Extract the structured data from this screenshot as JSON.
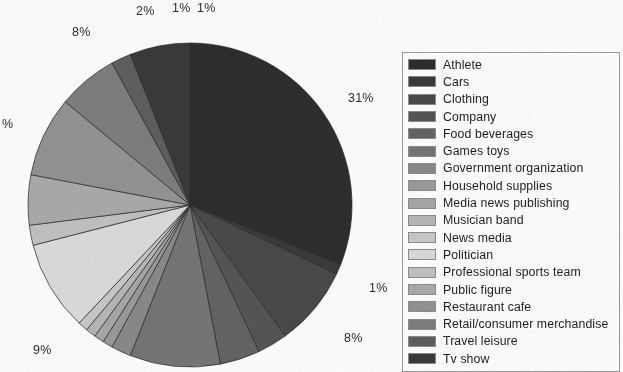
{
  "chart_data": {
    "type": "pie",
    "title": "",
    "legend_position": "right",
    "categories": [
      "Athlete",
      "Cars",
      "Clothing",
      "Company",
      "Food beverages",
      "Games toys",
      "Government organization",
      "Household supplies",
      "Media news publishing",
      "Musician band",
      "News media",
      "Politician",
      "Professional sports team",
      "Public figure",
      "Restaurant cafe",
      "Retail/consumer merchandise",
      "Travel leisure",
      "Tv show"
    ],
    "values": [
      31,
      1,
      8,
      3,
      4,
      9,
      2,
      1,
      1,
      1,
      1,
      9,
      2,
      5,
      8,
      6,
      2,
      6
    ],
    "colors": [
      "#2e2e2e",
      "#3b3b3b",
      "#4a4a4a",
      "#565656",
      "#646464",
      "#767676",
      "#8a8a8a",
      "#9b9b9b",
      "#a8a8a8",
      "#b8b8b8",
      "#c9c9c9",
      "#dcdcdc",
      "#c2c2c2",
      "#ababab",
      "#949494",
      "#7e7e7e",
      "#5f5f5f",
      "#3a3a3a"
    ],
    "slice_labels": [
      "31%",
      "1%",
      "8%",
      "9%",
      "%",
      "8%",
      "2%",
      "1%",
      "1%"
    ],
    "annotations": [
      {
        "text": "31%",
        "x": 348,
        "y": 91
      },
      {
        "text": "1%",
        "x": 369,
        "y": 281
      },
      {
        "text": "8%",
        "x": 344,
        "y": 331
      },
      {
        "text": "9%",
        "x": 33,
        "y": 343
      },
      {
        "text": "%",
        "x": 2,
        "y": 117
      },
      {
        "text": "8%",
        "x": 72,
        "y": 25
      },
      {
        "text": "2%",
        "x": 136,
        "y": 4
      },
      {
        "text": "1%",
        "x": 172,
        "y": 1
      },
      {
        "text": "1%",
        "x": 197,
        "y": 1
      }
    ]
  },
  "legend": {
    "items": [
      {
        "label": "Athlete",
        "color": "#2e2e2e"
      },
      {
        "label": "Cars",
        "color": "#3b3b3b"
      },
      {
        "label": "Clothing",
        "color": "#4a4a4a"
      },
      {
        "label": "Company",
        "color": "#565656"
      },
      {
        "label": "Food beverages",
        "color": "#646464"
      },
      {
        "label": "Games toys",
        "color": "#767676"
      },
      {
        "label": "Government organization",
        "color": "#8a8a8a"
      },
      {
        "label": "Household supplies",
        "color": "#9b9b9b"
      },
      {
        "label": "Media news publishing",
        "color": "#a8a8a8"
      },
      {
        "label": "Musician band",
        "color": "#b8b8b8"
      },
      {
        "label": "News media",
        "color": "#c9c9c9"
      },
      {
        "label": "Politician",
        "color": "#dcdcdc"
      },
      {
        "label": "Professional sports team",
        "color": "#c2c2c2"
      },
      {
        "label": "Public figure",
        "color": "#ababab"
      },
      {
        "label": "Restaurant cafe",
        "color": "#949494"
      },
      {
        "label": "Retail/consumer merchandise",
        "color": "#7e7e7e"
      },
      {
        "label": "Travel leisure",
        "color": "#5f5f5f"
      },
      {
        "label": "Tv show",
        "color": "#3a3a3a"
      }
    ]
  }
}
